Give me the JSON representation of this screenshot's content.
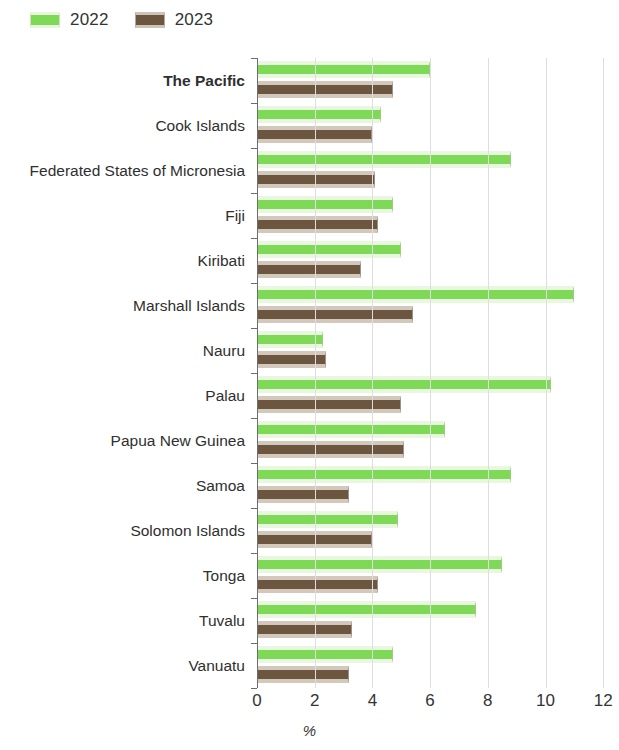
{
  "legend": {
    "position": "top-left",
    "entries": [
      {
        "label": "2022",
        "color": "#7ed957"
      },
      {
        "label": "2023",
        "color": "#6d5640"
      }
    ]
  },
  "axis": {
    "xlabel": "%",
    "xticks": [
      "0",
      "2",
      "4",
      "6",
      "8",
      "10",
      "12"
    ],
    "xmin": 0,
    "xmax": 12
  },
  "chart_data": {
    "type": "bar",
    "orientation": "horizontal",
    "title": "",
    "subtitle": "",
    "xlabel": "%",
    "ylabel": "",
    "xlim": [
      0,
      12
    ],
    "xticks": [
      0,
      2,
      4,
      6,
      8,
      10,
      12
    ],
    "grid": "vertical",
    "legend_position": "top-left",
    "categories": [
      "The Pacific",
      "Cook Islands",
      "Federated States of Micronesia",
      "Fiji",
      "Kiribati",
      "Marshall Islands",
      "Nauru",
      "Palau",
      "Papua New Guinea",
      "Samoa",
      "Solomon Islands",
      "Tonga",
      "Tuvalu",
      "Vanuatu"
    ],
    "emphasized_categories": [
      "The Pacific"
    ],
    "series": [
      {
        "name": "2022",
        "color": "#7ed957",
        "values": [
          6.0,
          4.3,
          8.8,
          4.7,
          5.0,
          11.0,
          2.3,
          10.2,
          6.5,
          8.8,
          4.9,
          8.5,
          7.6,
          4.7
        ]
      },
      {
        "name": "2023",
        "color": "#6d5640",
        "values": [
          4.7,
          4.0,
          4.1,
          4.2,
          3.6,
          5.4,
          2.4,
          5.0,
          5.1,
          3.2,
          4.0,
          4.2,
          3.3,
          3.2
        ]
      }
    ]
  }
}
